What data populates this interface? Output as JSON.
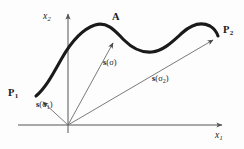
{
  "figure": {
    "background_color": "#fdfdfd",
    "curve_color": "#1a1a1a",
    "axis_color": "#555555",
    "vector_color": "#6b6b6b"
  },
  "axes": {
    "x_label": "x",
    "x_subscript": "1",
    "y_label": "x",
    "y_subscript": "2",
    "origin": {
      "x": 68,
      "y": 125
    },
    "x_range": [
      18,
      226
    ],
    "y_range": [
      10,
      133
    ]
  },
  "points": [
    {
      "id": "P1",
      "label": "P",
      "subscript": "1",
      "x": 36,
      "y": 96
    },
    {
      "id": "A",
      "label": "A",
      "subscript": "",
      "x": 115,
      "y": 38
    },
    {
      "id": "P2",
      "label": "P",
      "subscript": "2",
      "x": 218,
      "y": 36
    }
  ],
  "vectors": [
    {
      "id": "s-sigma-1",
      "label": "s",
      "arg": "(σ",
      "subscript": "1",
      "close": ")",
      "from": {
        "x": 68,
        "y": 125
      },
      "to": {
        "x": 40,
        "y": 99
      }
    },
    {
      "id": "s-sigma",
      "label": "s",
      "arg": "(σ",
      "subscript": "",
      "close": ")",
      "from": {
        "x": 68,
        "y": 125
      },
      "to": {
        "x": 114,
        "y": 40
      }
    },
    {
      "id": "s-sigma-2",
      "label": "s",
      "arg": "(σ",
      "subscript": "2",
      "close": ")",
      "from": {
        "x": 68,
        "y": 125
      },
      "to": {
        "x": 215,
        "y": 38
      }
    }
  ],
  "curve": {
    "description": "smooth wavy curve from P1 through A to P2",
    "path": "M 36,96 C 46,88 54,72 62,58 C 70,44 80,30 95,25 C 108,21 116,32 124,40 C 133,49 142,53 152,52 C 163,51 172,42 182,33 C 192,24 202,22 210,26 C 215,29 217,33 218,36"
  }
}
